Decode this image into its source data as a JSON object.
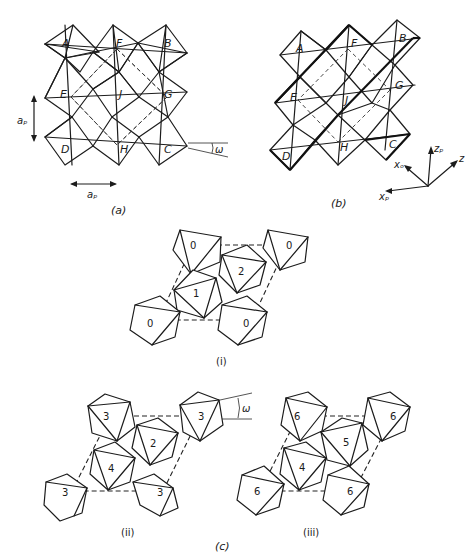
{
  "figure": {
    "panel_a": {
      "caption": "(a)",
      "octahedron_labels": [
        "A",
        "F",
        "B",
        "E",
        "J",
        "G",
        "D",
        "H",
        "C"
      ],
      "dimension_vertical": "aₚ",
      "dimension_horizontal": "aₚ",
      "tilt_angle_label": "ω"
    },
    "panel_b": {
      "caption": "(b)",
      "octahedron_labels": [
        "A",
        "F",
        "B",
        "E",
        "J",
        "G",
        "D",
        "H",
        "C"
      ],
      "axes": {
        "z_p": "zₚ",
        "z": "z",
        "x_o": "xₒ",
        "x_p": "xₚ"
      }
    },
    "panel_c": {
      "caption": "(c)",
      "sub_i": {
        "caption": "(i)",
        "labels": {
          "corner_tl": "0",
          "corner_tr": "0",
          "corner_bl": "0",
          "corner_br": "0",
          "center_1": "1",
          "center_2": "2"
        }
      },
      "sub_ii": {
        "caption": "(ii)",
        "tilt_angle_label": "ω",
        "labels": {
          "corner_tl": "3",
          "corner_tr": "3",
          "corner_bl": "3",
          "corner_br": "3",
          "center_4": "4",
          "center_2": "2"
        }
      },
      "sub_iii": {
        "caption": "(iii)",
        "labels": {
          "corner_tl": "6",
          "corner_tr": "6",
          "corner_bl": "6",
          "corner_br": "6",
          "center_4": "4",
          "center_5": "5"
        }
      }
    }
  }
}
